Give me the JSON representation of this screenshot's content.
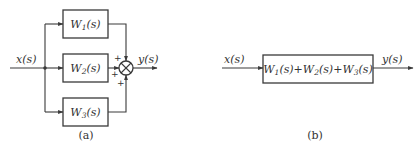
{
  "diagram_a": {
    "caption": "(a)",
    "input_label": "x(s)",
    "output_label": "y(s)",
    "blocks": [
      {
        "name": "W",
        "sub": "1",
        "arg": "(s)"
      },
      {
        "name": "W",
        "sub": "2",
        "arg": "(s)"
      },
      {
        "name": "W",
        "sub": "3",
        "arg": "(s)"
      }
    ],
    "summing_junction": {
      "signs": [
        "+",
        "+",
        "+"
      ]
    }
  },
  "diagram_b": {
    "caption": "(b)",
    "input_label": "x(s)",
    "output_label": "y(s)",
    "block": {
      "terms": [
        {
          "name": "W",
          "sub": "1",
          "arg": "(s)"
        },
        {
          "name": "W",
          "sub": "2",
          "arg": "(s)"
        },
        {
          "name": "W",
          "sub": "3",
          "arg": "(s)"
        }
      ],
      "operator": "+"
    }
  },
  "colors": {
    "stroke": "#3a3a3a",
    "text": "#333333",
    "background": "#ffffff"
  }
}
